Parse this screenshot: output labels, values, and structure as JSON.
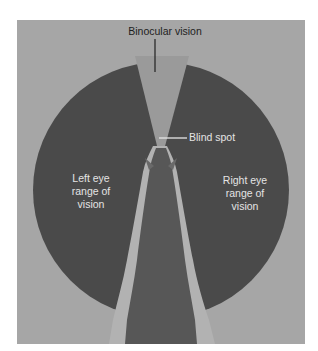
{
  "diagram": {
    "labels": {
      "binocular": "Binocular vision",
      "blind_spot": "Blind spot",
      "left_eye": [
        "Left eye",
        "range of",
        "vision"
      ],
      "right_eye": [
        "Right eye",
        "range of",
        "vision"
      ]
    },
    "colors": {
      "background": "#a6a6a6",
      "vision_field": "#4a4a4a",
      "binocular_wedge": "#9a9a9a",
      "horse_body": "#555555",
      "horse_outline": "#b5b5b5",
      "leader_line_dark": "#2a2a2a",
      "leader_line_light": "#e6e6e6"
    }
  }
}
